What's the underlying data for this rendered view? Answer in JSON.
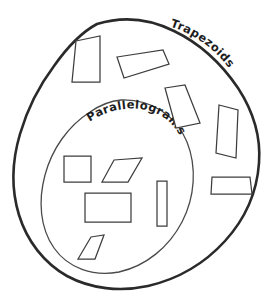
{
  "diagram": {
    "kind": "nested-set-venn-diagram",
    "background_color": "#ffffff",
    "outer_stroke_color": "#2a2a2a",
    "inner_stroke_color": "#4a4a4a",
    "shape_stroke_color": "#3d3d3d",
    "label_color": "#1d1d1d"
  },
  "sets": {
    "outer": {
      "label": "Trapezoids",
      "label_position": "upper-right along boundary"
    },
    "inner": {
      "label": "Parallelograms",
      "label_position": "upper-left inside along boundary"
    }
  },
  "shapes": {
    "trapezoids": [
      {
        "name": "trapezoid-top-left",
        "points": "76,41 100,36 100,82 72,82"
      },
      {
        "name": "trapezoid-top-right",
        "points": "117,57 163,50 169,64 124,78"
      },
      {
        "name": "trapezoid-mid-right",
        "points": "165,88 185,85 200,123 176,128"
      },
      {
        "name": "trapezoid-right-tall",
        "points": "219,105 238,110 236,158 216,153"
      },
      {
        "name": "trapezoid-lower-right",
        "points": "212,177 250,177 252,194 211,194"
      }
    ],
    "parallelograms": [
      {
        "name": "square-inner-left",
        "points": "64,156 91,156 91,182 64,182"
      },
      {
        "name": "parallelogram-inner-upper",
        "points": "114,160 142,158 128,182 102,182"
      },
      {
        "name": "rectangle-inner-wide",
        "points": "85,193 131,193 131,222 85,222"
      },
      {
        "name": "rectangle-inner-tall",
        "points": "157,181 167,181 167,226 157,226"
      },
      {
        "name": "parallelogram-inner-lower",
        "points": "91,237 104,235 95,259 78,259"
      }
    ]
  }
}
